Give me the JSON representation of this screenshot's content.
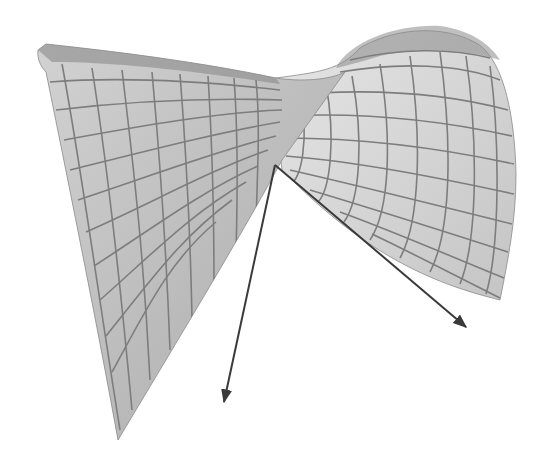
{
  "figure": {
    "width": 546,
    "height": 463,
    "background": "#ffffff"
  },
  "colors": {
    "surface_left_light": "#d2d2d2",
    "surface_left_dark": "#a9a9a9",
    "surface_right_light": "#e6e6e6",
    "surface_right_dark": "#c4c4c4",
    "grid_line": "#7d7d7d",
    "arrow": "#3a3a3a",
    "edge_dark": "#8a8a8a"
  },
  "surface": {
    "left_sheet": "M38,50 L46,44 C120,52 200,62 276,78 C300,82 330,80 345,72 L282,160 C250,220 190,320 118,440 C100,340 72,200 46,72 C40,66 37,58 38,50 Z",
    "back_band": "M38,50 L46,44 C120,52 200,62 276,78 L280,84 C200,72 120,62 52,62 Z",
    "right_dome": "M276,78 C320,72 340,70 360,48 C390,30 440,22 478,44 C505,62 515,120 516,175 C516,220 508,260 500,300 C440,285 370,260 282,170 C278,140 278,110 276,78 Z",
    "dome_top_shadow": "M336,68 C350,40 400,24 440,26 C470,30 490,44 500,60 C470,50 420,46 380,56 C360,62 345,66 336,68 Z"
  },
  "grid": {
    "left_sheet_u_lines": [
      "M62,64 C80,160 96,280 120,430",
      "M92,68 C108,170 120,280 132,410",
      "M122,70 C134,170 144,260 150,380",
      "M152,72 C160,160 166,240 170,350",
      "M180,74 C186,150 190,220 192,318",
      "M208,76 C212,140 214,200 214,286",
      "M234,78 C238,130 238,180 236,254",
      "M256,80 C260,120 258,160 256,222"
    ],
    "left_sheet_v_lines": [
      "M50,82 C130,76 210,82 280,90",
      "M56,110 C140,100 220,98 282,100",
      "M64,140 C140,126 220,112 282,110",
      "M70,170 C150,150 220,132 280,122",
      "M78,200 C150,176 220,150 276,136",
      "M86,232 C150,204 210,170 268,150",
      "M94,266 C150,230 200,192 258,166",
      "M100,300 C150,256 190,214 246,182",
      "M106,336 C148,284 180,238 232,200",
      "M112,372 C144,314 168,262 216,222"
    ],
    "right_dome_u_lines": [
      "M300,92 C310,140 300,180 292,182",
      "M326,84 C336,140 330,190 318,202",
      "M352,76 C364,140 360,200 344,222",
      "M380,64 C392,140 390,210 370,240",
      "M410,56 C422,140 420,222 400,258",
      "M440,52 C452,140 452,230 430,272",
      "M466,56 C478,140 478,240 460,284",
      "M490,66 C500,140 500,248 486,294"
    ],
    "right_dome_v_lines": [
      "M280,96 C360,88 440,92 508,110",
      "M282,116 C360,112 440,120 512,136",
      "M284,138 C360,138 440,148 514,164",
      "M286,156 C360,162 440,178 514,194",
      "M290,170 C360,186 440,206 512,224",
      "M310,190 C370,208 440,230 508,252",
      "M340,212 C390,230 450,256 504,278",
      "M372,234 C410,252 460,278 500,298",
      "M350,60 C400,48 450,48 490,58",
      "M340,72 C400,62 460,64 500,80"
    ]
  },
  "vectors": [
    {
      "name": "vector-down",
      "start": [
        275,
        165
      ],
      "end": [
        224,
        402
      ]
    },
    {
      "name": "vector-right",
      "start": [
        275,
        165
      ],
      "end": [
        466,
        327
      ]
    }
  ]
}
